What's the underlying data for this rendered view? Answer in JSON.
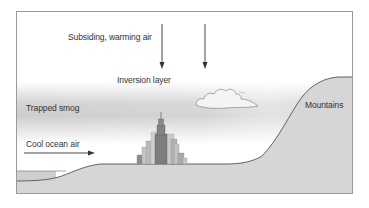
{
  "diagram": {
    "type": "temperature-inversion-illustration",
    "labels": {
      "subsiding_air": "Subsiding, warming air",
      "inversion_layer": "Inversion layer",
      "trapped_smog": "Trapped smog",
      "cool_ocean_air": "Cool ocean air",
      "mountains": "Mountains"
    },
    "elements": {
      "downward_arrows": 2,
      "ocean_air_arrow": "right",
      "cloud": "cumulus cloud in inversion layer",
      "city": "city skyline with central skyscraper"
    },
    "colors": {
      "frame": "#9a9a9a",
      "ground": "#d6d6d6",
      "ground_line": "#555555",
      "smog": "#d0d0d0",
      "sky": "#ffffff",
      "text": "#333333",
      "arrow": "#333333",
      "building_dark": "#7d7d7d",
      "building_mid": "#a8a8a8",
      "building_light": "#c8c8c8"
    }
  }
}
